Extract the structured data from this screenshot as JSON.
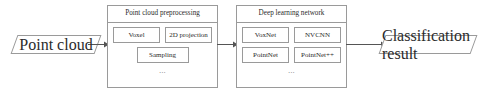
{
  "diagram": {
    "background_color": "#ffffff",
    "line_color": "#9a9a9a",
    "text_color": "#2b2b2b"
  },
  "input": {
    "label": "Point cloud",
    "shape": "parallelogram"
  },
  "output": {
    "label": "Classification result",
    "shape": "parallelogram"
  },
  "stages": [
    {
      "id": "preprocessing",
      "header": "Point cloud preprocessing",
      "rows": [
        [
          "Voxel",
          "2D projection"
        ],
        [
          "Sampling"
        ]
      ],
      "ellipsis": "..."
    },
    {
      "id": "network",
      "header": "Deep learning network",
      "rows": [
        [
          "VoxNet",
          "NVCNN"
        ],
        [
          "PointNet",
          "PointNet++"
        ]
      ],
      "ellipsis": "..."
    }
  ],
  "items": {
    "voxel": "Voxel",
    "projection_2d": "2D projection",
    "sampling": "Sampling",
    "voxnet": "VoxNet",
    "nvcnn": "NVCNN",
    "pointnet": "PointNet",
    "pointnet_pp": "PointNet++"
  },
  "headers": {
    "preprocessing": "Point cloud preprocessing",
    "network": "Deep learning network"
  },
  "ellipsis": {
    "preprocessing": "...",
    "network": "..."
  },
  "arrows": [
    {
      "name": "input-to-preprocessing",
      "from": "Point cloud",
      "to": "Point cloud preprocessing"
    },
    {
      "name": "preprocessing-to-network",
      "from": "Point cloud preprocessing",
      "to": "Deep learning network"
    },
    {
      "name": "network-to-output",
      "from": "Deep learning network",
      "to": "Classification result"
    }
  ]
}
